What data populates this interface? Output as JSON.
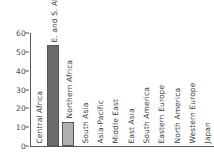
{
  "chart_data": {
    "type": "bar",
    "title": "",
    "xlabel": "",
    "ylabel": "",
    "ylim": [
      0,
      60
    ],
    "yticks": [
      0,
      10,
      20,
      30,
      40,
      50,
      60
    ],
    "grid": false,
    "legend": "none",
    "categories": [
      "Central Africa",
      "E. and S. Afr",
      "Northern Africa",
      "South Asia",
      "Asia-Pacific",
      "Middle East",
      "East Asia",
      "South America",
      "Eastern Europe",
      "North America",
      "Western Europe",
      "Japan"
    ],
    "values": [
      0,
      53.5,
      13,
      0,
      0,
      0,
      0,
      0,
      0,
      0,
      0,
      0
    ],
    "bar_colors": [
      "#6b6b6b",
      "#6b6b6b",
      "#b0b0b0",
      "#b0b0b0",
      "#b0b0b0",
      "#b0b0b0",
      "#b0b0b0",
      "#b0b0b0",
      "#b0b0b0",
      "#b0b0b0",
      "#b0b0b0",
      "#b0b0b0"
    ]
  },
  "axis": {
    "line_color": "#5a5a5a",
    "tick_text_color": "#4a4a4a",
    "category_text_color": "#3c3c3c"
  }
}
